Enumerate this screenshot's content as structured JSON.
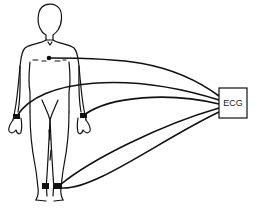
{
  "diagram": {
    "device_label": "ECG",
    "electrodes": [
      {
        "name": "chest"
      },
      {
        "name": "right-wrist"
      },
      {
        "name": "left-wrist"
      },
      {
        "name": "right-ankle"
      },
      {
        "name": "left-ankle"
      }
    ],
    "colors": {
      "line": "#111111",
      "background": "#ffffff"
    }
  }
}
